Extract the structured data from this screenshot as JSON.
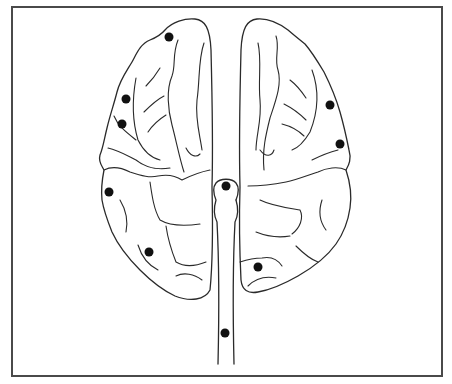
{
  "diagram": {
    "title": "",
    "frame": {
      "x": 12,
      "y": 7,
      "width": 430,
      "height": 369,
      "stroke": "#4a4a4a"
    },
    "line_color": "#2a2a2a",
    "dot_color": "#111111",
    "markers": [
      {
        "id": "left-frontal-top",
        "cx": 169,
        "cy": 37,
        "r": 4.5
      },
      {
        "id": "left-frontal-lateral-1",
        "cx": 126,
        "cy": 99,
        "r": 4.5
      },
      {
        "id": "left-frontal-lateral-2",
        "cx": 122,
        "cy": 124,
        "r": 4.5
      },
      {
        "id": "left-parietal",
        "cx": 109,
        "cy": 192,
        "r": 4.5
      },
      {
        "id": "left-occipital",
        "cx": 149,
        "cy": 252,
        "r": 4.5
      },
      {
        "id": "midline-vertex",
        "cx": 226,
        "cy": 186,
        "r": 4.5
      },
      {
        "id": "right-frontal-lateral-1",
        "cx": 330,
        "cy": 105,
        "r": 4.5
      },
      {
        "id": "right-frontal-lateral-2",
        "cx": 340,
        "cy": 144,
        "r": 4.5
      },
      {
        "id": "right-occipital",
        "cx": 258,
        "cy": 267,
        "r": 4.5
      },
      {
        "id": "brainstem",
        "cx": 225,
        "cy": 333,
        "r": 4.5
      }
    ]
  }
}
